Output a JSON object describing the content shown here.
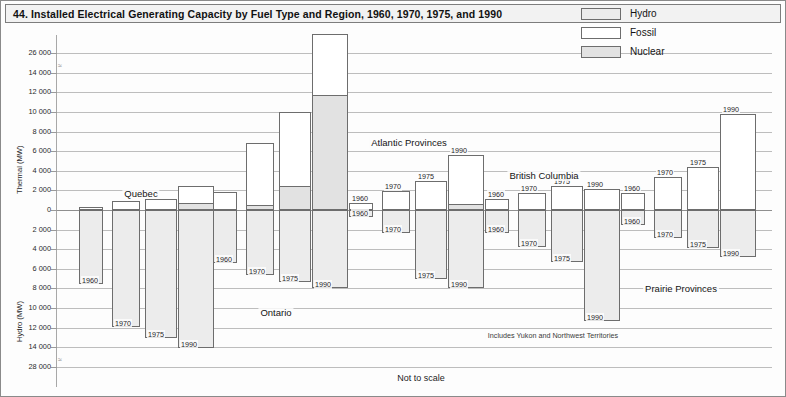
{
  "title": "44. Installed Electrical Generating Capacity by Fuel Type and Region, 1960, 1970, 1975, and 1990",
  "legend": {
    "items": [
      {
        "label": "Hydro",
        "color": "#ececec",
        "key": "hydro"
      },
      {
        "label": "Fossil",
        "color": "#ffffff",
        "key": "fossil"
      },
      {
        "label": "Nuclear",
        "color": "#e2e2e2",
        "key": "nuclear"
      }
    ]
  },
  "axes": {
    "upper_title": "Thermal (MW)",
    "lower_title": "Hydro (MW)",
    "upper_ticks": [
      "26 000",
      "14 000",
      "12 000",
      "10 000",
      "8 000",
      "6 000",
      "4 000",
      "2 000",
      "0"
    ],
    "lower_ticks": [
      "0",
      "2 000",
      "4 000",
      "6 000",
      "8 000",
      "10 000",
      "12 000",
      "14 000",
      "28 000"
    ],
    "break_symbol": "≈"
  },
  "notes": {
    "not_to_scale": "Not to scale",
    "yukon": "Includes Yukon and Northwest Territories"
  },
  "chart_data": {
    "type": "bar",
    "title": "44. Installed Electrical Generating Capacity by Fuel Type and Region, 1960, 1970, 1975, and 1990",
    "subtitle": "Not to scale",
    "xlabel": "",
    "ylabel_up": "Thermal (MW)",
    "ylabel_down": "Hydro (MW)",
    "ylim_up": [
      0,
      26000
    ],
    "ylim_down": [
      0,
      28000
    ],
    "axis_break_up": "between 14 000 and 26 000",
    "axis_break_down": "between 14 000 and 28 000",
    "grid": true,
    "legend_position": "top-right",
    "years": [
      "1960",
      "1970",
      "1975",
      "1990"
    ],
    "series": [
      "Hydro",
      "Fossil",
      "Nuclear"
    ],
    "regions": [
      {
        "name": "Quebec",
        "label_x": 140,
        "bars": [
          {
            "year": "1960",
            "hydro": 7600,
            "fossil": 300,
            "nuclear": 0
          },
          {
            "year": "1970",
            "hydro": 11900,
            "fossil": 900,
            "nuclear": 0
          },
          {
            "year": "1975",
            "hydro": 13100,
            "fossil": 1000,
            "nuclear": 100
          },
          {
            "year": "1990",
            "hydro": 14600,
            "fossil": 1800,
            "nuclear": 700
          }
        ]
      },
      {
        "name": "Ontario",
        "label_x": 275,
        "bars": [
          {
            "year": "1960",
            "hydro": 5400,
            "fossil": 1800,
            "nuclear": 0
          },
          {
            "year": "1970",
            "hydro": 6600,
            "fossil": 6300,
            "nuclear": 500
          },
          {
            "year": "1975",
            "hydro": 7300,
            "fossil": 7600,
            "nuclear": 2400
          },
          {
            "year": "1990",
            "hydro": 8000,
            "fossil": 25800,
            "nuclear": 11700
          }
        ]
      },
      {
        "name": "Atlantic Provinces",
        "label_x": 408,
        "bars": [
          {
            "year": "1960",
            "hydro": 700,
            "fossil": 700,
            "nuclear": 0
          },
          {
            "year": "1970",
            "hydro": 2300,
            "fossil": 1900,
            "nuclear": 0
          },
          {
            "year": "1975",
            "hydro": 7000,
            "fossil": 3000,
            "nuclear": 0
          },
          {
            "year": "1990",
            "hydro": 8000,
            "fossil": 5000,
            "nuclear": 600
          }
        ]
      },
      {
        "name": "British Columbia",
        "label_x": 543,
        "bars": [
          {
            "year": "1960",
            "hydro": 2300,
            "fossil": 1100,
            "nuclear": 0
          },
          {
            "year": "1970",
            "hydro": 3800,
            "fossil": 1700,
            "nuclear": 0
          },
          {
            "year": "1975",
            "hydro": 5300,
            "fossil": 2400,
            "nuclear": 0
          },
          {
            "year": "1990",
            "hydro": 11300,
            "fossil": 2100,
            "nuclear": 0
          }
        ]
      },
      {
        "name": "Prairie Provinces",
        "label_x": 680,
        "bars": [
          {
            "year": "1960",
            "hydro": 1500,
            "fossil": 1700,
            "nuclear": 0
          },
          {
            "year": "1970",
            "hydro": 2900,
            "fossil": 3400,
            "nuclear": 0
          },
          {
            "year": "1975",
            "hydro": 3900,
            "fossil": 4400,
            "nuclear": 0
          },
          {
            "year": "1990",
            "hydro": 4800,
            "fossil": 9800,
            "nuclear": 0
          }
        ]
      }
    ]
  }
}
